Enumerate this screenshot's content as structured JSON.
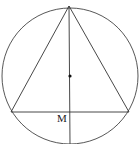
{
  "diagram": {
    "type": "geometry",
    "circle": {
      "cx": 70,
      "cy": 76,
      "r": 68
    },
    "apex": {
      "x": 69,
      "y": 6
    },
    "base_left": {
      "x": 11,
      "y": 112
    },
    "base_right": {
      "x": 129,
      "y": 112
    },
    "center_point": {
      "x": 70,
      "y": 76
    },
    "labels": {
      "midpoint": "M"
    },
    "colors": {
      "stroke": "#333333",
      "background": "#ffffff"
    }
  }
}
